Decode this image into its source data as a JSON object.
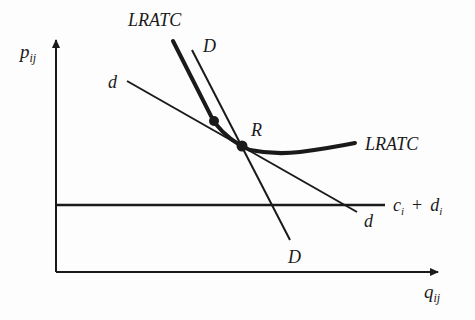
{
  "diagram": {
    "axes": {
      "y_label": "p",
      "y_label_sub": "ij",
      "x_label": "q",
      "x_label_sub": "ij"
    },
    "curves": {
      "lratc_top_label": "LRATC",
      "lratc_right_label": "LRATC",
      "D_top_label": "D",
      "D_bottom_label": "D",
      "d_left_label": "d",
      "d_right_label": "d"
    },
    "points": {
      "R_label": "R"
    },
    "cost_line": {
      "c_label": "c",
      "c_sub": "i",
      "plus": "+",
      "d_label": "d",
      "d_sub": "i"
    },
    "colors": {
      "ink": "#1a1a1a",
      "background": "#fdfdfd"
    }
  }
}
